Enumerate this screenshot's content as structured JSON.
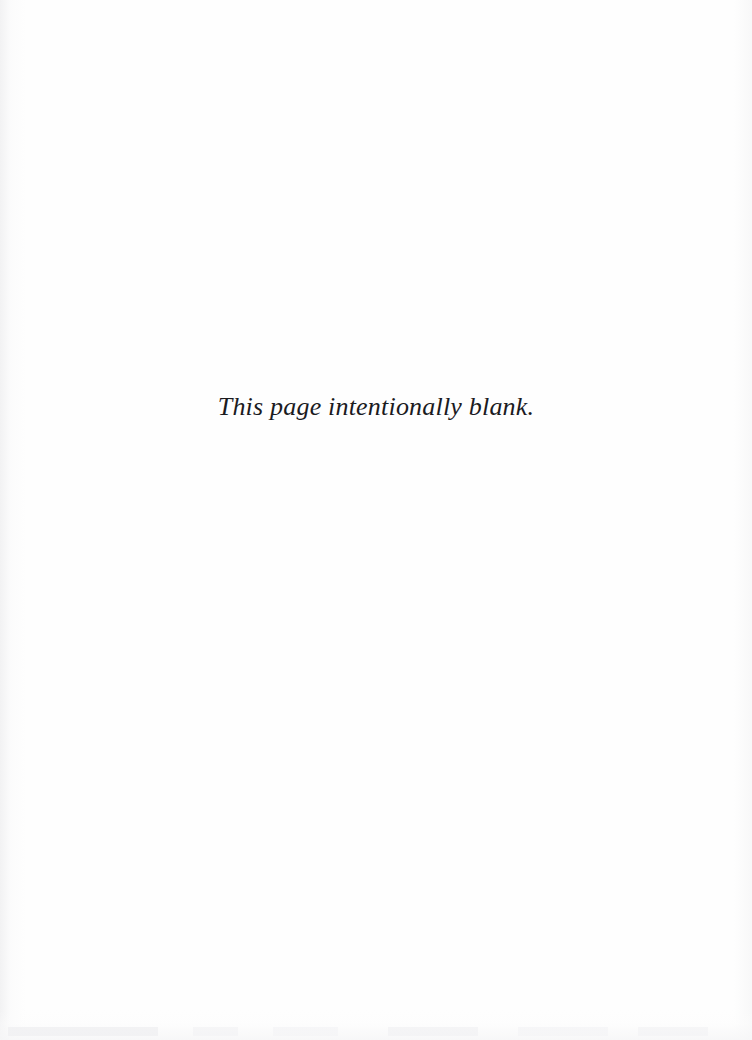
{
  "page": {
    "width": 752,
    "height": 1040,
    "background_color": "#fefefe",
    "text_color": "#1b1b1f"
  },
  "body": {
    "notice": "This page intentionally blank."
  },
  "artifacts": {
    "left_edge": "scan-streak",
    "right_edge": "scan-speckle",
    "bottom_edge": "page-show-through"
  }
}
